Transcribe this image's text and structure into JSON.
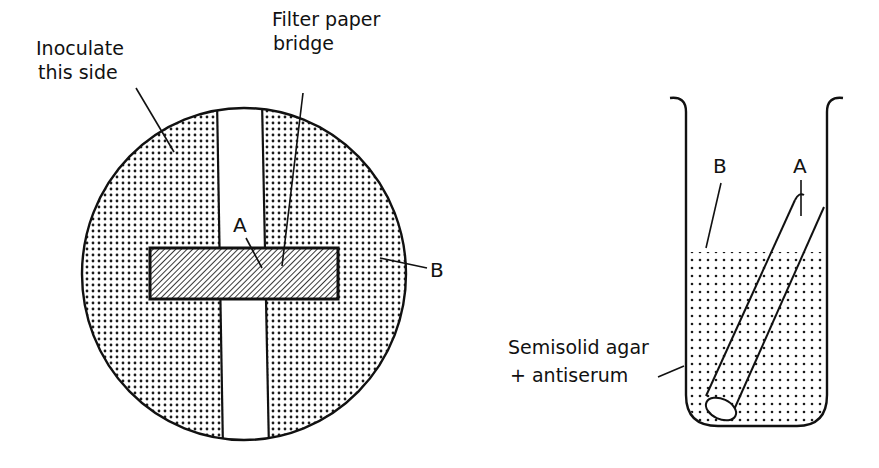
{
  "plate_diagram": {
    "label_inoculate_line1": "Inoculate",
    "label_inoculate_line2": "this side",
    "label_filter_line1": "Filter paper",
    "label_filter_line2": "bridge",
    "label_a": "A",
    "label_b": "B"
  },
  "tube_diagram": {
    "label_a": "A",
    "label_b": "B",
    "label_agar_line1": "Semisolid agar",
    "label_agar_line2": "+ antiserum"
  },
  "colors": {
    "stroke": "#111111",
    "background": "#ffffff",
    "dot": "#1a1a1a"
  }
}
